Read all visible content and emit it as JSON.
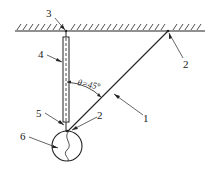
{
  "diagram": {
    "type": "mechanical-schematic",
    "angle_label": "θ=45°",
    "labels": {
      "cable": "1",
      "anchor_top": "2",
      "anchor_bottom": "2",
      "ceiling_hook": "3",
      "rod": "4",
      "rod_end": "5",
      "ball": "6"
    },
    "colors": {
      "line": "#222222",
      "background": "#ffffff"
    }
  }
}
